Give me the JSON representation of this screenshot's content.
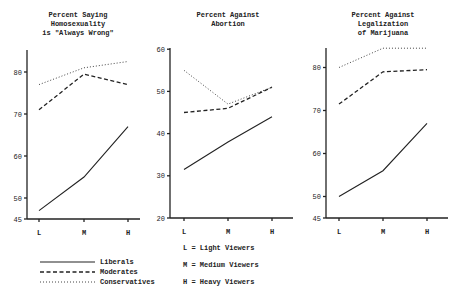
{
  "chart_data": [
    {
      "type": "line",
      "title": "Percent Saying Homosexuality is \"Always Wrong\"",
      "title_lines": [
        "Percent Saying",
        "Homosexuality",
        "is \"Always Wrong\""
      ],
      "categories": [
        "L",
        "M",
        "H"
      ],
      "yticks": [
        45,
        50,
        60,
        70,
        80
      ],
      "ylim": [
        45,
        85
      ],
      "series": [
        {
          "name": "Liberals",
          "values": [
            47,
            55,
            67
          ]
        },
        {
          "name": "Moderates",
          "values": [
            71,
            79.5,
            77
          ]
        },
        {
          "name": "Conservatives",
          "values": [
            77,
            81,
            82.5
          ]
        }
      ]
    },
    {
      "type": "line",
      "title": "Percent Against Abortion",
      "title_lines": [
        "Percent Against",
        "Abortion"
      ],
      "categories": [
        "L",
        "M",
        "H"
      ],
      "yticks": [
        20,
        30,
        40,
        50,
        60
      ],
      "ylim": [
        20,
        60
      ],
      "series": [
        {
          "name": "Liberals",
          "values": [
            31.5,
            38,
            44
          ]
        },
        {
          "name": "Moderates",
          "values": [
            45,
            46,
            51
          ]
        },
        {
          "name": "Conservatives",
          "values": [
            55,
            47,
            51
          ]
        }
      ]
    },
    {
      "type": "line",
      "title": "Percent Against Legalization of Marijuana",
      "title_lines": [
        "Percent Against",
        "Legalization",
        "of Marijuana"
      ],
      "categories": [
        "L",
        "M",
        "H"
      ],
      "yticks": [
        45,
        50,
        60,
        70,
        80
      ],
      "ylim": [
        45,
        85
      ],
      "series": [
        {
          "name": "Liberals",
          "values": [
            50,
            56,
            67
          ]
        },
        {
          "name": "Moderates",
          "values": [
            71.5,
            79,
            79.5
          ]
        },
        {
          "name": "Conservatives",
          "values": [
            80,
            84.5,
            84.5
          ]
        }
      ]
    }
  ],
  "legend": {
    "lines": [
      "Liberals",
      "Moderates",
      "Conservatives"
    ],
    "key": [
      "L = Light Viewers",
      "M = Medium Viewers",
      "H = Heavy Viewers"
    ]
  }
}
